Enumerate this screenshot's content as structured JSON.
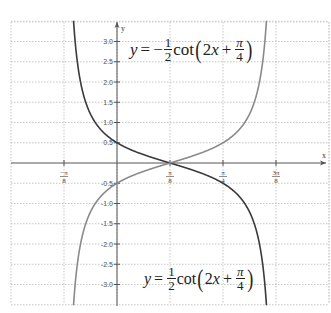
{
  "chart_data": {
    "type": "line",
    "title": "",
    "xlabel": "x",
    "ylabel": "y",
    "x_ticks": [
      "-π/8",
      "π/8",
      "π/4",
      "3π/8"
    ],
    "x_tick_values": [
      -0.3927,
      0.3927,
      0.7854,
      1.1781
    ],
    "y_ticks": [
      "3.0",
      "2.5",
      "2.0",
      "1.5",
      "1.0",
      "0.5",
      "-0.5",
      "-1.0",
      "-1.5",
      "-2.0",
      "-2.5",
      "-3.0"
    ],
    "y_tick_values": [
      3.0,
      2.5,
      2.0,
      1.5,
      1.0,
      0.5,
      -0.5,
      -1.0,
      -1.5,
      -2.0,
      -2.5,
      -3.0
    ],
    "xlim": [
      -0.59,
      1.37
    ],
    "ylim": [
      -3.5,
      3.5
    ],
    "grid": true,
    "asymptotes_x": [
      -0.3927,
      1.1781
    ],
    "series": [
      {
        "name": "y = -1/2 cot(2x + π/4)",
        "label_position": "top",
        "color": "#3a3a3a",
        "points": [
          [
            -0.3,
            3.2
          ],
          [
            -0.2,
            1.37
          ],
          [
            -0.1,
            0.83
          ],
          [
            0,
            0.5
          ],
          [
            0.1,
            0.26
          ],
          [
            0.3927,
            0
          ],
          [
            0.6,
            -0.2
          ],
          [
            0.7854,
            -0.5
          ],
          [
            0.9,
            -0.83
          ],
          [
            1.0,
            -1.37
          ],
          [
            1.08,
            -2.5
          ],
          [
            1.12,
            -3.4
          ]
        ]
      },
      {
        "name": "y = 1/2 cot(2x + π/4)",
        "label_position": "bottom",
        "color": "#8a8a8a",
        "points": [
          [
            -0.3,
            -3.2
          ],
          [
            -0.2,
            -1.37
          ],
          [
            -0.1,
            -0.83
          ],
          [
            0,
            -0.5
          ],
          [
            0.1,
            -0.26
          ],
          [
            0.3927,
            0
          ],
          [
            0.6,
            0.2
          ],
          [
            0.7854,
            0.5
          ],
          [
            0.9,
            0.83
          ],
          [
            1.0,
            1.37
          ],
          [
            1.08,
            2.5
          ],
          [
            1.12,
            3.4
          ]
        ]
      }
    ],
    "annotations": [
      {
        "text": "y = -1/2 cot(2x + π/4)",
        "near": "upper-center"
      },
      {
        "text": "y = 1/2 cot(2x + π/4)",
        "near": "lower-center"
      }
    ]
  },
  "labels": {
    "x_axis": "x",
    "y_axis": "y",
    "eq_top": {
      "y": "y",
      "eq": "=",
      "sign": "−",
      "num": "1",
      "den": "2",
      "fn": "cot",
      "arg_a": "2",
      "arg_x": "x",
      "plus": "+",
      "pi": "π",
      "four": "4"
    },
    "eq_bottom": {
      "y": "y",
      "eq": "=",
      "sign": "",
      "num": "1",
      "den": "2",
      "fn": "cot",
      "arg_a": "2",
      "arg_x": "x",
      "plus": "+",
      "pi": "π",
      "four": "4"
    }
  }
}
